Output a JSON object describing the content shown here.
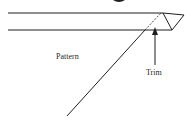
{
  "diagram": {
    "labels": {
      "pattern": "Pattern",
      "trim": "Trim"
    },
    "colors": {
      "stroke": "#1f1f1f",
      "background": "#ffffff"
    }
  }
}
